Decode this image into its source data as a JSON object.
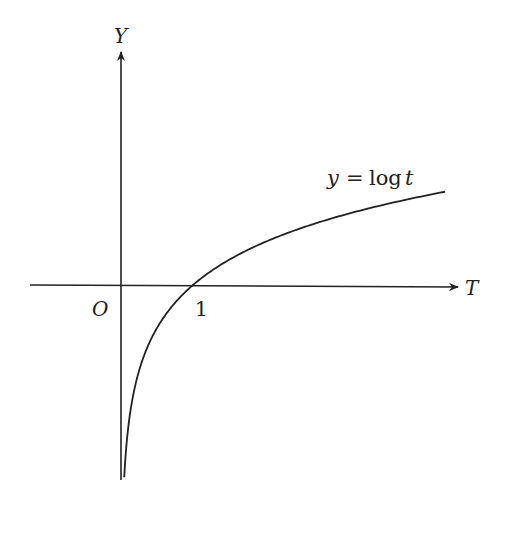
{
  "figure": {
    "y_axis_label": "Y",
    "x_axis_label": "T",
    "origin_label": "O",
    "tick_label": "1",
    "curve_label": "y = log t",
    "curve_label_parts": {
      "lhs": "y",
      "eq": "=",
      "fn": "log",
      "var": "t"
    }
  },
  "chart_data": {
    "type": "line",
    "title": "",
    "xlabel": "T",
    "ylabel": "Y",
    "function": "y = ln(t)",
    "series": [
      {
        "name": "y = log t",
        "t_range": [
          0.045,
          4.5
        ]
      }
    ],
    "ticks": {
      "x": [
        1
      ]
    },
    "xlim": [
      -1.25,
      4.5
    ],
    "ylim": [
      -3.2,
      3.5
    ],
    "grid": false,
    "legend": "none"
  },
  "colors": {
    "ink": "#222222",
    "background": "#ffffff"
  }
}
